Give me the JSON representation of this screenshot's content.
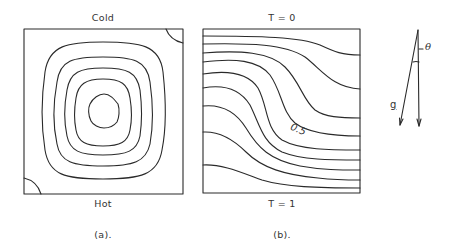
{
  "figure": {
    "panels": [
      {
        "id": "a",
        "caption": "(a).",
        "top_label": "Cold",
        "bottom_label": "Hot",
        "content": "streamlines",
        "contour_count": 5,
        "corner_cells": [
          "top-right",
          "bottom-left"
        ]
      },
      {
        "id": "b",
        "caption": "(b).",
        "top_label": "T = 0",
        "bottom_label": "T = 1",
        "content": "isotherms",
        "contour_label": "0.5",
        "contour_count": 9
      }
    ],
    "gravity_diagram": {
      "vector_label": "g",
      "angle_label": "θ"
    },
    "colors": {
      "line": "#2a2a2a",
      "background": "#ffffff"
    }
  }
}
